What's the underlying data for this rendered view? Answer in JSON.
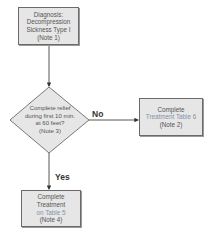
{
  "diagram": {
    "type": "flowchart",
    "nodes": {
      "diagnosis": {
        "shape": "rectangle",
        "lines": [
          "Diagnosis:",
          "Decompression",
          "Sickness Type I",
          "(Note 1)"
        ]
      },
      "decision": {
        "shape": "diamond",
        "lines": [
          "Complete relief",
          "during first 10 min.",
          "at 60 feet?",
          "(Note 3)"
        ]
      },
      "table6": {
        "shape": "rectangle",
        "lines": [
          "Complete",
          "Treatment Table 6",
          "(Note 2)"
        ]
      },
      "table5": {
        "shape": "rectangle",
        "lines": [
          "Complete",
          "Treatment",
          "on Table 5",
          "(Note 4)"
        ]
      }
    },
    "edges": [
      {
        "from": "diagnosis",
        "to": "decision",
        "label": ""
      },
      {
        "from": "decision",
        "to": "table6",
        "label": "No"
      },
      {
        "from": "decision",
        "to": "table5",
        "label": "Yes"
      }
    ],
    "colors": {
      "box_fill": "#e6e6e6",
      "box_border": "#6a6a6a",
      "line": "#444444",
      "link_text": "#7f93ad"
    }
  }
}
